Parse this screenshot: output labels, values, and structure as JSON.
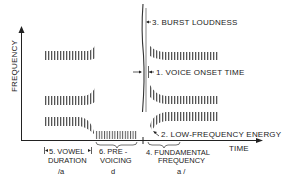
{
  "diagram": {
    "axes": {
      "y_label": "FREQUENCY",
      "x_label": "TIME"
    },
    "annotations": [
      {
        "id": "burst",
        "label": "3. BURST LOUDNESS"
      },
      {
        "id": "vot",
        "label": "1. VOICE ONSET TIME"
      },
      {
        "id": "lfe",
        "label": "2. LOW-FREQUENCY ENERGY"
      }
    ],
    "bottom_labels": {
      "vowel_duration_line1": "5. VOWEL",
      "vowel_duration_line2": "DURATION",
      "prevoicing_line1": "6. PRE -",
      "prevoicing_line2": "VOICING",
      "fundamental_line1": "4. FUNDAMENTAL",
      "fundamental_line2": "FREQUENCY"
    },
    "segments": {
      "first_vowel": "/a",
      "consonant": "d",
      "second_vowel": "a /"
    },
    "colors": {
      "ink": "#222222",
      "background": "#ffffff"
    }
  }
}
